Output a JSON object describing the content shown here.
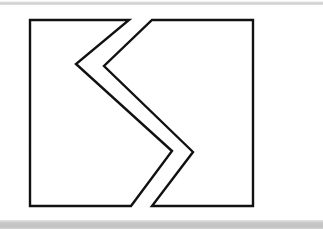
{
  "canvas": {
    "width": 323,
    "height": 229,
    "background_color": "#ffffff"
  },
  "decor": {
    "top_band": {
      "label": "top-scan-band",
      "color": "#d4d4d4",
      "y": 1,
      "height": 4
    },
    "bottom_band": {
      "label": "bottom-scan-band",
      "color": "#c6c6c6",
      "y": 220,
      "height": 9
    }
  },
  "figure": {
    "stroke_color": "#111111",
    "fill_color": "#ffffff",
    "stroke_width": 2.4,
    "bounds": {
      "left": 30,
      "top": 20,
      "right": 253,
      "bottom": 206
    },
    "pieces": [
      {
        "name": "left-piece",
        "description": "Left portion of the rectangle with a chevron notch cut out of its right side",
        "points": "30,20 129,20 76,64 172,151 131,206 30,206"
      },
      {
        "name": "right-piece",
        "description": "Right portion: rectangle edge plus the chevron arm pointing right",
        "points": "152,20 253,20 253,206 152,206 193,152 104,66"
      }
    ],
    "vertices": [
      {
        "name": "rect-top-left",
        "x": 30,
        "y": 20
      },
      {
        "name": "rect-top-right",
        "x": 253,
        "y": 20
      },
      {
        "name": "rect-bottom-right",
        "x": 253,
        "y": 206
      },
      {
        "name": "rect-bottom-left",
        "x": 30,
        "y": 206
      },
      {
        "name": "cut-outer-top",
        "x": 129,
        "y": 20
      },
      {
        "name": "cut-outer-left-vertex",
        "x": 76,
        "y": 64
      },
      {
        "name": "cut-outer-right-tip",
        "x": 172,
        "y": 151
      },
      {
        "name": "cut-outer-bottom",
        "x": 131,
        "y": 206
      },
      {
        "name": "cut-inner-top",
        "x": 152,
        "y": 20
      },
      {
        "name": "cut-inner-left-vertex",
        "x": 104,
        "y": 66
      },
      {
        "name": "cut-inner-right-tip",
        "x": 193,
        "y": 152
      },
      {
        "name": "cut-inner-bottom",
        "x": 152,
        "y": 206
      }
    ]
  }
}
